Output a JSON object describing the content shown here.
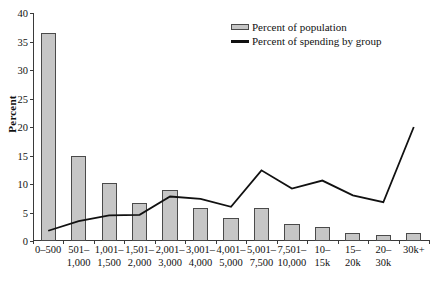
{
  "chart_data": {
    "type": "bar",
    "title": "",
    "xlabel": "",
    "ylabel": "Percent",
    "ylim": [
      0,
      40
    ],
    "yticks": [
      0,
      5,
      10,
      15,
      20,
      25,
      30,
      35,
      40
    ],
    "grid": false,
    "legend_position": "top-right",
    "categories": [
      "0–500",
      "501–\n1,000",
      "1,001–\n1,500",
      "1,501–\n2,000",
      "2,001–\n3,000",
      "3,001–\n4,000",
      "4,001–\n5,000",
      "5,001–\n7,500",
      "7,501–\n10,000",
      "10–\n15k",
      "15–\n20k",
      "20–\n30k",
      "30k+"
    ],
    "series": [
      {
        "name": "Percent of population",
        "type": "bar",
        "color": "#c6c6c6",
        "edge_color": "#4a4a4a",
        "values": [
          36.5,
          15.0,
          10.1,
          6.6,
          9.0,
          5.8,
          4.0,
          5.8,
          3.0,
          2.4,
          1.4,
          1.0,
          1.4
        ]
      },
      {
        "name": "Percent of spending by group",
        "type": "line",
        "color": "#111111",
        "values": [
          1.8,
          3.5,
          4.5,
          4.6,
          7.8,
          7.4,
          6.0,
          12.4,
          9.2,
          10.6,
          8.0,
          6.8,
          20.0
        ]
      }
    ]
  },
  "legend": {
    "items": [
      {
        "label": "Percent of population",
        "marker": "bar-swatch"
      },
      {
        "label": "Percent of spending by group",
        "marker": "line-swatch"
      }
    ]
  },
  "axis": {
    "y_title": "Percent"
  }
}
